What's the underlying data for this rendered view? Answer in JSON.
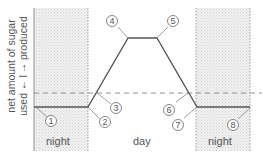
{
  "diagram": {
    "y_axis": {
      "title": "net amount of sugar",
      "positive_label": "produced",
      "negative_label": "used",
      "positive_arrow": "→",
      "negative_arrow": "←"
    },
    "regions": [
      {
        "label": "night",
        "shaded": true
      },
      {
        "label": "day",
        "shaded": false
      },
      {
        "label": "night",
        "shaded": true
      }
    ],
    "markers": [
      {
        "id": "1",
        "label": "1"
      },
      {
        "id": "2",
        "label": "2"
      },
      {
        "id": "3",
        "label": "3"
      },
      {
        "id": "4",
        "label": "4"
      },
      {
        "id": "5",
        "label": "5"
      },
      {
        "id": "6",
        "label": "6"
      },
      {
        "id": "7",
        "label": "7"
      },
      {
        "id": "8",
        "label": "8"
      }
    ],
    "colors": {
      "line": "#555555",
      "shading": "#e6e6e6",
      "dashed_zero": "#777777"
    }
  }
}
